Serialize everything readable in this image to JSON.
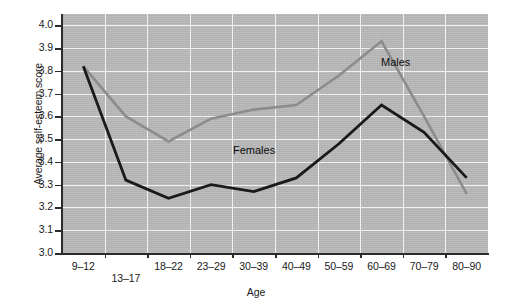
{
  "chart_data": {
    "type": "line",
    "title": "",
    "xlabel": "Age",
    "ylabel": "Average self-esteem score",
    "categories": [
      "9–12",
      "13–17",
      "18–22",
      "23–29",
      "30–39",
      "40–49",
      "50–59",
      "60–69",
      "70–79",
      "80–90"
    ],
    "ylim": [
      3.0,
      4.0
    ],
    "yticks": [
      "3.0",
      "3.1",
      "3.2",
      "3.3",
      "3.4",
      "3.5",
      "3.6",
      "3.7",
      "3.8",
      "3.9",
      "4.0"
    ],
    "grid": true,
    "legend_position": "inline-annotation",
    "series": [
      {
        "name": "Males",
        "color": "#8c8c8c",
        "values": [
          3.82,
          3.6,
          3.49,
          3.59,
          3.63,
          3.65,
          3.78,
          3.93,
          3.6,
          3.26
        ]
      },
      {
        "name": "Females",
        "color": "#1a1a1a",
        "values": [
          3.82,
          3.32,
          3.24,
          3.3,
          3.27,
          3.33,
          3.48,
          3.65,
          3.53,
          3.33
        ]
      }
    ],
    "annotations": [
      {
        "text": "Males",
        "series": "Males"
      },
      {
        "text": "Females",
        "series": "Females"
      }
    ],
    "plot_background": "#b9b9b9",
    "grid_color": "#f0f0f0",
    "axis_color": "#2b2b2b"
  }
}
